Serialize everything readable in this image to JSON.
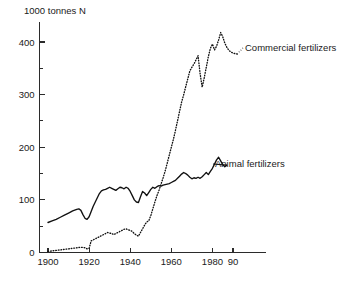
{
  "chart_data": {
    "type": "line",
    "title": "",
    "subtitle": "",
    "ylabel": "1000 tonnes N",
    "xlabel": "",
    "xlim": [
      1896,
      1998
    ],
    "ylim": [
      0,
      440
    ],
    "grid": false,
    "legend_position": "inline-annotation",
    "y_ticks_major": [
      0,
      100,
      200,
      300,
      400
    ],
    "y_ticks_minor": [
      50,
      150,
      250,
      350
    ],
    "x_ticks_major": [
      1900,
      1920,
      1940,
      1960,
      1980,
      1990
    ],
    "x_tick_labels": [
      "1900",
      "1920",
      "1940",
      "1960",
      "1980",
      "90"
    ],
    "annotations": [
      {
        "text": "Commercial fertilizers",
        "x": 1992,
        "y": 385
      },
      {
        "text": "Animal fertilizers",
        "x": 1988,
        "y": 178
      }
    ],
    "series": [
      {
        "name": "Animal fertilizers",
        "style": "solid",
        "x": [
          1900,
          1902,
          1904,
          1906,
          1908,
          1910,
          1912,
          1914,
          1915,
          1916,
          1917,
          1918,
          1919,
          1920,
          1921,
          1922,
          1923,
          1924,
          1925,
          1926,
          1927,
          1928,
          1929,
          1930,
          1931,
          1932,
          1933,
          1934,
          1935,
          1936,
          1937,
          1938,
          1939,
          1940,
          1941,
          1942,
          1943,
          1944,
          1945,
          1946,
          1947,
          1948,
          1949,
          1950,
          1951,
          1952,
          1953,
          1954,
          1955,
          1956,
          1957,
          1958,
          1959,
          1960,
          1961,
          1962,
          1963,
          1964,
          1965,
          1966,
          1967,
          1968,
          1969,
          1970,
          1971,
          1972,
          1973,
          1974,
          1975,
          1976,
          1977,
          1978,
          1979,
          1980,
          1981,
          1982,
          1983,
          1984,
          1985,
          1986,
          1987
        ],
        "y": [
          57,
          60,
          63,
          67,
          71,
          75,
          79,
          82,
          83,
          80,
          72,
          65,
          63,
          68,
          78,
          88,
          96,
          104,
          112,
          117,
          119,
          120,
          122,
          124,
          122,
          120,
          118,
          121,
          124,
          123,
          121,
          124,
          122,
          116,
          108,
          100,
          96,
          95,
          106,
          116,
          113,
          108,
          114,
          120,
          124,
          122,
          125,
          127,
          126,
          128,
          129,
          130,
          131,
          133,
          135,
          137,
          141,
          145,
          149,
          152,
          150,
          147,
          143,
          140,
          142,
          141,
          143,
          141,
          144,
          148,
          152,
          148,
          154,
          160,
          168,
          176,
          181,
          174,
          167,
          163,
          166
        ]
      },
      {
        "name": "Commercial fertilizers",
        "style": "dotted",
        "x": [
          1900,
          1902,
          1904,
          1906,
          1908,
          1910,
          1912,
          1914,
          1916,
          1918,
          1919,
          1920,
          1921,
          1922,
          1923,
          1924,
          1925,
          1926,
          1927,
          1928,
          1929,
          1930,
          1931,
          1932,
          1933,
          1934,
          1935,
          1936,
          1937,
          1938,
          1939,
          1940,
          1941,
          1942,
          1943,
          1944,
          1945,
          1946,
          1947,
          1948,
          1949,
          1950,
          1951,
          1952,
          1953,
          1954,
          1955,
          1956,
          1957,
          1958,
          1959,
          1960,
          1961,
          1962,
          1963,
          1964,
          1965,
          1966,
          1967,
          1968,
          1969,
          1970,
          1971,
          1972,
          1973,
          1974,
          1975,
          1976,
          1977,
          1978,
          1979,
          1980,
          1981,
          1982,
          1983,
          1984,
          1985,
          1986,
          1987,
          1988,
          1989,
          1990,
          1991,
          1992
        ],
        "y": [
          2,
          3,
          4,
          5,
          6,
          7,
          8,
          9,
          10,
          9,
          7,
          8,
          22,
          24,
          26,
          28,
          30,
          32,
          34,
          36,
          38,
          37,
          36,
          34,
          36,
          38,
          40,
          42,
          44,
          45,
          43,
          42,
          40,
          36,
          33,
          31,
          38,
          45,
          52,
          58,
          60,
          70,
          83,
          96,
          108,
          118,
          130,
          142,
          155,
          170,
          185,
          200,
          215,
          232,
          250,
          268,
          286,
          300,
          315,
          330,
          345,
          352,
          358,
          366,
          374,
          340,
          314,
          332,
          352,
          372,
          388,
          396,
          385,
          392,
          404,
          418,
          410,
          398,
          390,
          384,
          381,
          379,
          378,
          377
        ]
      }
    ]
  },
  "figure": {
    "y_axis_title": "1000 tonnes N"
  }
}
